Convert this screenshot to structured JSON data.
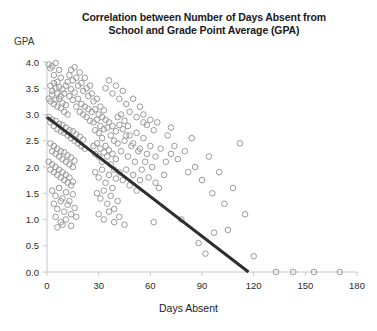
{
  "chart": {
    "title_line1": "Correlation between Number of Days Absent from",
    "title_line2": "School and Grade Point Average (GPA)",
    "ylabel": "GPA",
    "xlabel": "Days Absent"
  },
  "chart_data": {
    "type": "scatter",
    "title": "Correlation between Number of Days Absent from School and Grade Point Average (GPA)",
    "xlabel": "Days Absent",
    "ylabel": "GPA",
    "xlim": [
      0,
      180
    ],
    "ylim": [
      0.0,
      4.0
    ],
    "xticks": [
      0,
      30,
      60,
      90,
      120,
      150,
      180
    ],
    "yticks": [
      0.0,
      0.5,
      1.0,
      1.5,
      2.0,
      2.5,
      3.0,
      3.5,
      4.0
    ],
    "xtick_labels": [
      "0",
      "30",
      "60",
      "90",
      "120",
      "150",
      "180"
    ],
    "ytick_labels": [
      "0.0",
      "0.5",
      "1.0",
      "1.5",
      "2.0",
      "2.5",
      "3.0",
      "3.5",
      "4.0"
    ],
    "grid": false,
    "legend": false,
    "marker": {
      "shape": "open-circle",
      "radius": 2.8,
      "stroke": "#9a9a9a",
      "fill": "none"
    },
    "trendline": {
      "type": "linear",
      "color": "#2e2e2e",
      "width": 3,
      "x_start": 0,
      "y_start": 2.95,
      "x_end": 117,
      "y_end": 0.0,
      "slope": -0.0252,
      "intercept": 2.95
    },
    "series": [
      {
        "name": "Students",
        "points": [
          [
            1,
            3.95
          ],
          [
            2,
            3.88
          ],
          [
            3,
            3.92
          ],
          [
            4,
            3.75
          ],
          [
            5,
            3.98
          ],
          [
            6,
            3.62
          ],
          [
            7,
            3.85
          ],
          [
            8,
            3.7
          ],
          [
            2,
            3.55
          ],
          [
            3,
            3.45
          ],
          [
            4,
            3.6
          ],
          [
            5,
            3.5
          ],
          [
            6,
            3.4
          ],
          [
            7,
            3.52
          ],
          [
            8,
            3.35
          ],
          [
            9,
            3.48
          ],
          [
            1,
            3.3
          ],
          [
            2,
            3.25
          ],
          [
            3,
            3.38
          ],
          [
            4,
            3.2
          ],
          [
            5,
            3.28
          ],
          [
            6,
            3.15
          ],
          [
            7,
            3.3
          ],
          [
            8,
            3.12
          ],
          [
            9,
            3.22
          ],
          [
            10,
            3.05
          ],
          [
            11,
            3.18
          ],
          [
            12,
            3.0
          ],
          [
            10,
            3.4
          ],
          [
            11,
            3.55
          ],
          [
            12,
            3.62
          ],
          [
            13,
            3.35
          ],
          [
            14,
            3.48
          ],
          [
            15,
            3.28
          ],
          [
            16,
            3.42
          ],
          [
            17,
            3.15
          ],
          [
            18,
            3.3
          ],
          [
            19,
            3.05
          ],
          [
            13,
            3.75
          ],
          [
            14,
            3.85
          ],
          [
            15,
            3.65
          ],
          [
            16,
            3.9
          ],
          [
            17,
            3.7
          ],
          [
            18,
            3.55
          ],
          [
            19,
            3.8
          ],
          [
            20,
            3.6
          ],
          [
            21,
            3.45
          ],
          [
            22,
            3.7
          ],
          [
            23,
            3.5
          ],
          [
            24,
            3.35
          ],
          [
            25,
            3.55
          ],
          [
            26,
            3.4
          ],
          [
            20,
            3.2
          ],
          [
            21,
            3.0
          ],
          [
            22,
            3.15
          ],
          [
            23,
            2.95
          ],
          [
            24,
            3.1
          ],
          [
            25,
            2.88
          ],
          [
            26,
            3.05
          ],
          [
            1,
            2.95
          ],
          [
            2,
            2.85
          ],
          [
            3,
            2.9
          ],
          [
            4,
            2.78
          ],
          [
            5,
            2.88
          ],
          [
            6,
            2.72
          ],
          [
            7,
            2.82
          ],
          [
            8,
            2.68
          ],
          [
            9,
            2.8
          ],
          [
            10,
            2.65
          ],
          [
            11,
            2.75
          ],
          [
            12,
            2.6
          ],
          [
            13,
            2.7
          ],
          [
            14,
            2.55
          ],
          [
            15,
            2.68
          ],
          [
            16,
            2.5
          ],
          [
            17,
            2.62
          ],
          [
            18,
            2.45
          ],
          [
            19,
            2.58
          ],
          [
            20,
            2.4
          ],
          [
            21,
            2.52
          ],
          [
            22,
            2.35
          ],
          [
            2,
            2.45
          ],
          [
            3,
            2.3
          ],
          [
            4,
            2.4
          ],
          [
            5,
            2.25
          ],
          [
            6,
            2.35
          ],
          [
            7,
            2.2
          ],
          [
            8,
            2.3
          ],
          [
            9,
            2.15
          ],
          [
            10,
            2.28
          ],
          [
            11,
            2.1
          ],
          [
            12,
            2.22
          ],
          [
            13,
            2.05
          ],
          [
            14,
            2.18
          ],
          [
            15,
            2.0
          ],
          [
            16,
            2.12
          ],
          [
            1,
            2.1
          ],
          [
            2,
            1.95
          ],
          [
            3,
            2.05
          ],
          [
            4,
            1.9
          ],
          [
            5,
            2.0
          ],
          [
            6,
            1.85
          ],
          [
            7,
            1.95
          ],
          [
            8,
            1.8
          ],
          [
            9,
            1.9
          ],
          [
            10,
            1.75
          ],
          [
            11,
            1.85
          ],
          [
            12,
            1.7
          ],
          [
            13,
            1.8
          ],
          [
            14,
            1.65
          ],
          [
            15,
            1.72
          ],
          [
            3,
            1.55
          ],
          [
            5,
            1.45
          ],
          [
            7,
            1.6
          ],
          [
            9,
            1.4
          ],
          [
            11,
            1.52
          ],
          [
            13,
            1.35
          ],
          [
            15,
            1.48
          ],
          [
            4,
            1.3
          ],
          [
            6,
            1.2
          ],
          [
            8,
            1.35
          ],
          [
            10,
            1.15
          ],
          [
            12,
            1.28
          ],
          [
            14,
            1.1
          ],
          [
            16,
            1.22
          ],
          [
            5,
            1.05
          ],
          [
            8,
            0.95
          ],
          [
            11,
            1.0
          ],
          [
            14,
            0.88
          ],
          [
            17,
            1.05
          ],
          [
            6,
            0.85
          ],
          [
            9,
            0.9
          ],
          [
            27,
            3.25
          ],
          [
            28,
            3.1
          ],
          [
            29,
            3.3
          ],
          [
            30,
            3.0
          ],
          [
            31,
            3.15
          ],
          [
            32,
            2.95
          ],
          [
            33,
            3.08
          ],
          [
            27,
            2.85
          ],
          [
            28,
            2.7
          ],
          [
            29,
            2.9
          ],
          [
            30,
            2.65
          ],
          [
            31,
            2.78
          ],
          [
            32,
            2.55
          ],
          [
            33,
            2.72
          ],
          [
            34,
            2.9
          ],
          [
            35,
            2.75
          ],
          [
            36,
            2.85
          ],
          [
            37,
            2.6
          ],
          [
            38,
            2.78
          ],
          [
            39,
            2.5
          ],
          [
            40,
            2.68
          ],
          [
            27,
            2.4
          ],
          [
            28,
            2.25
          ],
          [
            29,
            2.45
          ],
          [
            30,
            2.2
          ],
          [
            31,
            2.35
          ],
          [
            32,
            2.1
          ],
          [
            33,
            2.28
          ],
          [
            34,
            2.4
          ],
          [
            35,
            2.2
          ],
          [
            36,
            2.32
          ],
          [
            37,
            2.05
          ],
          [
            38,
            2.25
          ],
          [
            39,
            1.95
          ],
          [
            40,
            2.15
          ],
          [
            28,
            1.9
          ],
          [
            30,
            1.8
          ],
          [
            32,
            1.95
          ],
          [
            34,
            1.7
          ],
          [
            36,
            1.85
          ],
          [
            38,
            1.6
          ],
          [
            40,
            1.78
          ],
          [
            29,
            1.5
          ],
          [
            31,
            1.4
          ],
          [
            33,
            1.55
          ],
          [
            35,
            1.3
          ],
          [
            37,
            1.45
          ],
          [
            39,
            1.2
          ],
          [
            41,
            1.35
          ],
          [
            30,
            1.1
          ],
          [
            33,
            1.0
          ],
          [
            36,
            1.15
          ],
          [
            39,
            0.95
          ],
          [
            42,
            1.05
          ],
          [
            45,
            0.9
          ],
          [
            34,
            3.5
          ],
          [
            36,
            3.65
          ],
          [
            38,
            3.4
          ],
          [
            40,
            3.55
          ],
          [
            42,
            3.3
          ],
          [
            44,
            3.45
          ],
          [
            41,
            2.95
          ],
          [
            42,
            2.8
          ],
          [
            43,
            3.0
          ],
          [
            44,
            2.72
          ],
          [
            45,
            2.88
          ],
          [
            46,
            2.6
          ],
          [
            47,
            2.78
          ],
          [
            41,
            2.45
          ],
          [
            43,
            2.3
          ],
          [
            45,
            2.5
          ],
          [
            47,
            2.2
          ],
          [
            49,
            2.4
          ],
          [
            51,
            2.1
          ],
          [
            53,
            2.3
          ],
          [
            42,
            1.9
          ],
          [
            44,
            1.75
          ],
          [
            46,
            1.95
          ],
          [
            48,
            1.65
          ],
          [
            50,
            1.85
          ],
          [
            52,
            1.55
          ],
          [
            54,
            1.75
          ],
          [
            46,
            3.2
          ],
          [
            48,
            3.05
          ],
          [
            50,
            3.3
          ],
          [
            52,
            2.95
          ],
          [
            54,
            3.15
          ],
          [
            56,
            2.85
          ],
          [
            48,
            2.6
          ],
          [
            50,
            2.45
          ],
          [
            52,
            2.65
          ],
          [
            54,
            2.35
          ],
          [
            56,
            2.55
          ],
          [
            58,
            2.25
          ],
          [
            55,
            1.95
          ],
          [
            57,
            2.1
          ],
          [
            59,
            1.8
          ],
          [
            61,
            2.0
          ],
          [
            63,
            1.7
          ],
          [
            56,
            3.0
          ],
          [
            58,
            2.8
          ],
          [
            60,
            2.9
          ],
          [
            62,
            2.7
          ],
          [
            64,
            2.85
          ],
          [
            60,
            2.4
          ],
          [
            63,
            2.2
          ],
          [
            66,
            2.35
          ],
          [
            69,
            2.1
          ],
          [
            72,
            2.25
          ],
          [
            62,
            0.95
          ],
          [
            65,
            1.6
          ],
          [
            68,
            1.85
          ],
          [
            70,
            2.6
          ],
          [
            72,
            2.75
          ],
          [
            74,
            2.4
          ],
          [
            76,
            2.15
          ],
          [
            78,
            1.0
          ],
          [
            80,
            2.3
          ],
          [
            82,
            1.9
          ],
          [
            84,
            2.55
          ],
          [
            86,
            2.0
          ],
          [
            88,
            0.55
          ],
          [
            90,
            1.75
          ],
          [
            92,
            0.35
          ],
          [
            94,
            2.2
          ],
          [
            96,
            1.5
          ],
          [
            97,
            0.75
          ],
          [
            100,
            1.9
          ],
          [
            103,
            1.3
          ],
          [
            105,
            0.8
          ],
          [
            108,
            1.6
          ],
          [
            112,
            2.45
          ],
          [
            115,
            1.1
          ],
          [
            120,
            0.3
          ],
          [
            133,
            0.0
          ],
          [
            143,
            0.0
          ],
          [
            155,
            0.0
          ],
          [
            170,
            0.0
          ]
        ]
      }
    ]
  }
}
